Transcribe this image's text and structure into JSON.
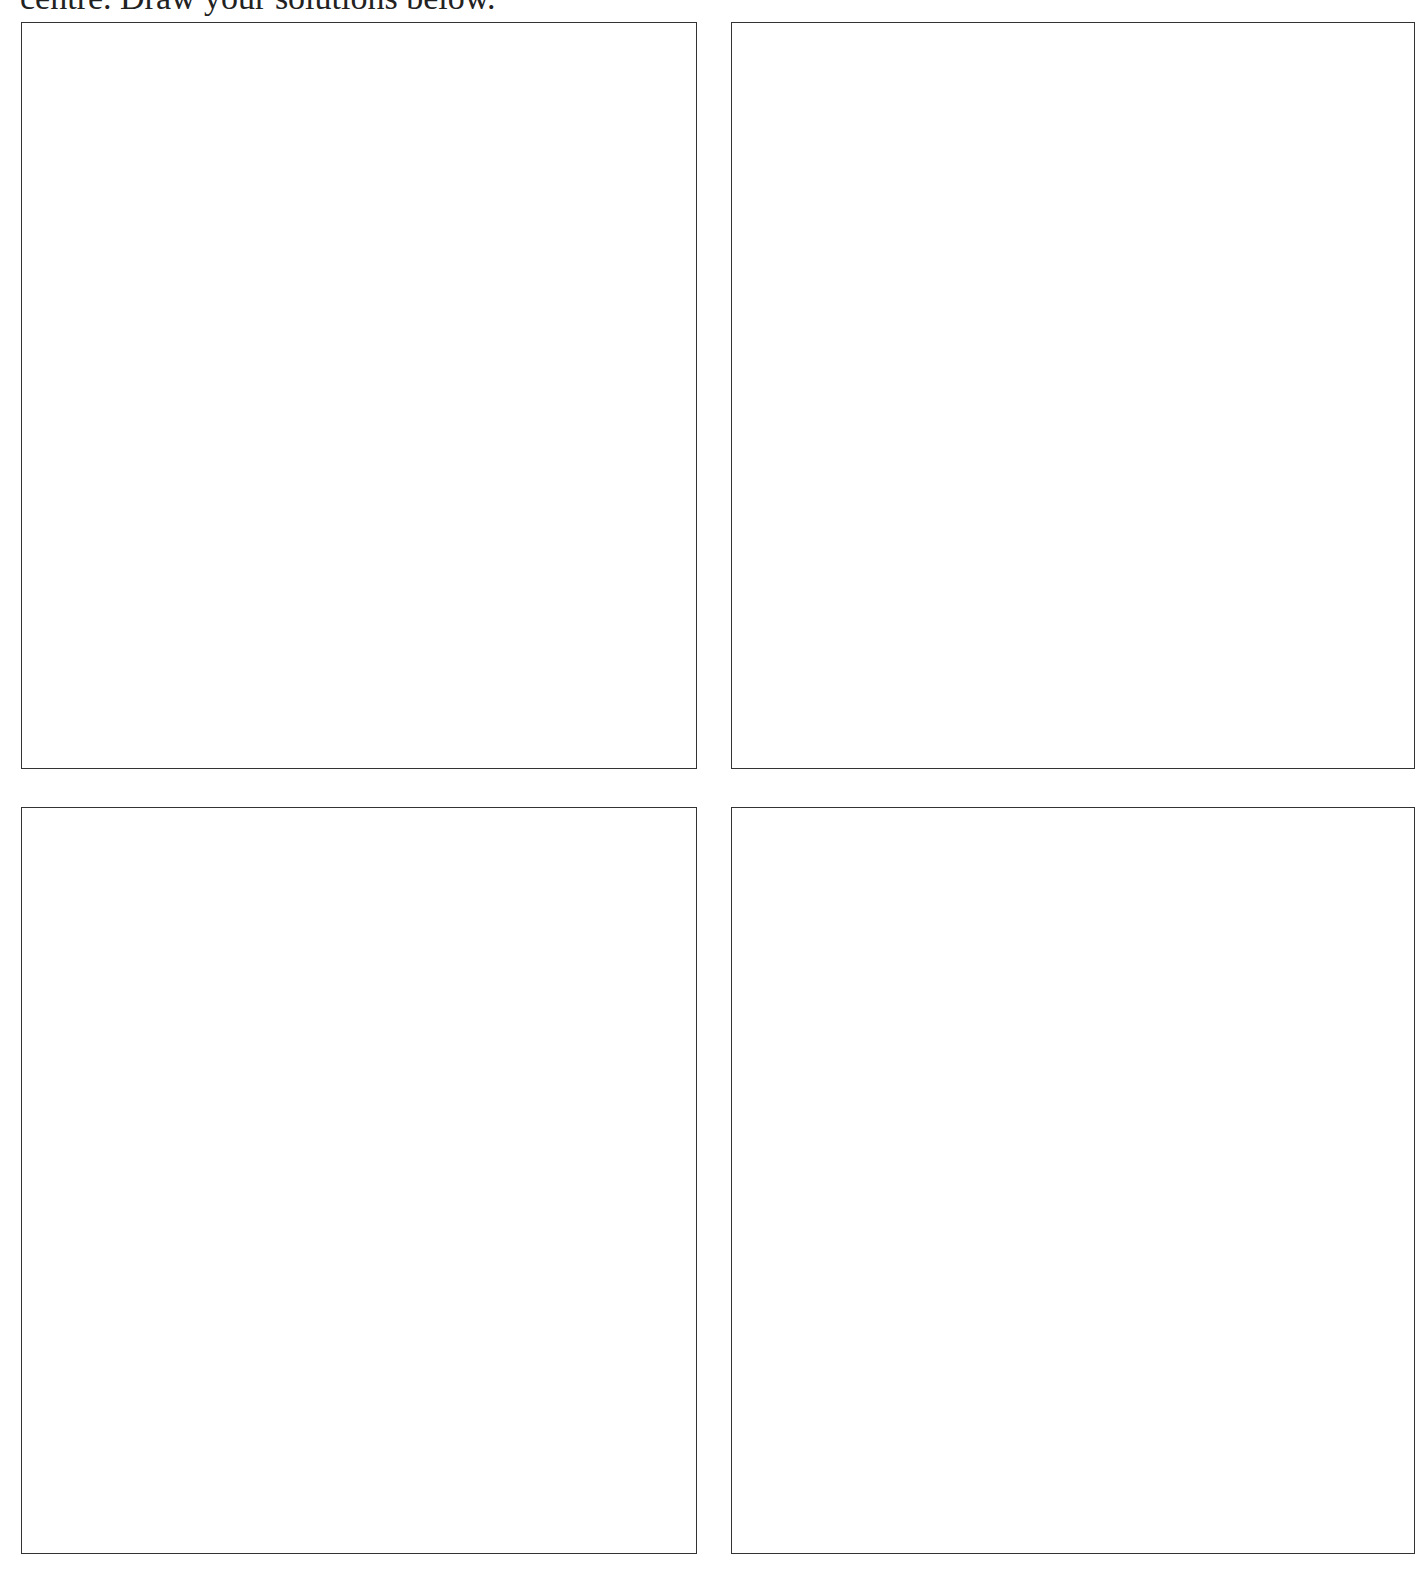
{
  "instruction": "centre. Draw your solutions below.",
  "answer_boxes": [
    {
      "label": "solution-box-1",
      "content": ""
    },
    {
      "label": "solution-box-2",
      "content": ""
    },
    {
      "label": "solution-box-3",
      "content": ""
    },
    {
      "label": "solution-box-4",
      "content": ""
    }
  ]
}
